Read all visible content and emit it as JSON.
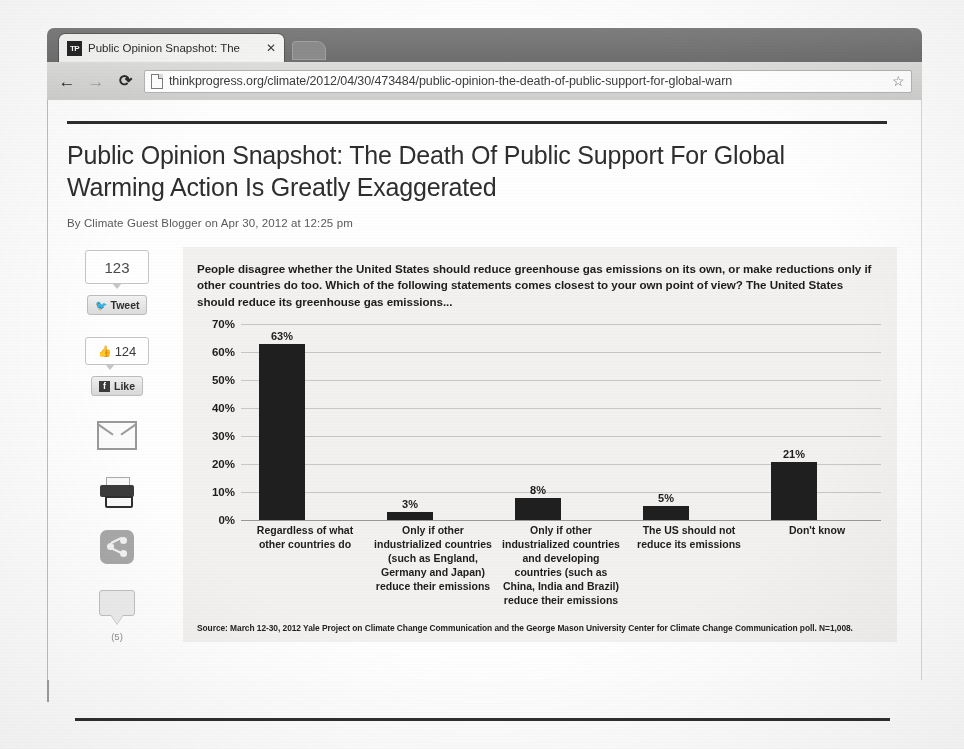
{
  "browser": {
    "tab": {
      "favicon_text": "TP",
      "title": "Public Opinion Snapshot: The",
      "close_label": "✕"
    },
    "toolbar": {
      "back_label": "←",
      "forward_label": "→",
      "reload_label": "⟳",
      "url": "thinkprogress.org/climate/2012/04/30/473484/public-opinion-the-death-of-public-support-for-global-warn",
      "bookmark_label": "☆"
    }
  },
  "article": {
    "headline": "Public Opinion Snapshot: The Death Of Public Support For Global Warming Action Is Greatly Exaggerated",
    "byline": "By Climate Guest Blogger on Apr 30, 2012 at 12:25 pm"
  },
  "share_rail": {
    "tweet_count": "123",
    "tweet_label": "Tweet",
    "tweet_icon": "bird-icon",
    "facebook_count": "124",
    "facebook_label": "Like",
    "facebook_icon": "facebook-f-icon",
    "thumb_icon": "thumbs-up-icon",
    "email_icon": "envelope-icon",
    "print_icon": "printer-icon",
    "share_icon": "share-nodes-icon",
    "comment_icon": "comment-bubble-icon",
    "comment_count": "(5)"
  },
  "chart_data": {
    "type": "bar",
    "title": "People disagree whether the United States should reduce greenhouse gas emissions on its own, or make reductions only if other countries do too. Which of the following statements comes closest to your own point of view? The United States should reduce its greenhouse gas emissions...",
    "categories": [
      "Regardless of what other countries do",
      "Only if other industrialized countries (such as England, Germany and Japan) reduce their emissions",
      "Only if other industrialized countries and developing countries (such as China, India and Brazil) reduce their emissions",
      "The US should not reduce its emissions",
      "Don't know"
    ],
    "values": [
      63,
      3,
      8,
      5,
      21
    ],
    "value_labels": [
      "63%",
      "3%",
      "8%",
      "5%",
      "21%"
    ],
    "ytick_labels": [
      "70%",
      "60%",
      "50%",
      "40%",
      "30%",
      "20%",
      "10%",
      "0%"
    ],
    "ytick_values": [
      70,
      60,
      50,
      40,
      30,
      20,
      10,
      0
    ],
    "ylim": [
      0,
      70
    ],
    "xlabel": "",
    "ylabel": "",
    "grid": true,
    "legend": "none",
    "bar_color": "#201f1f",
    "plot_background": "#f2f1ef",
    "source": "Source: March 12-30, 2012 Yale Project on Climate Change Communication and the George Mason University Center for Climate Change Communication poll. N=1,008."
  }
}
